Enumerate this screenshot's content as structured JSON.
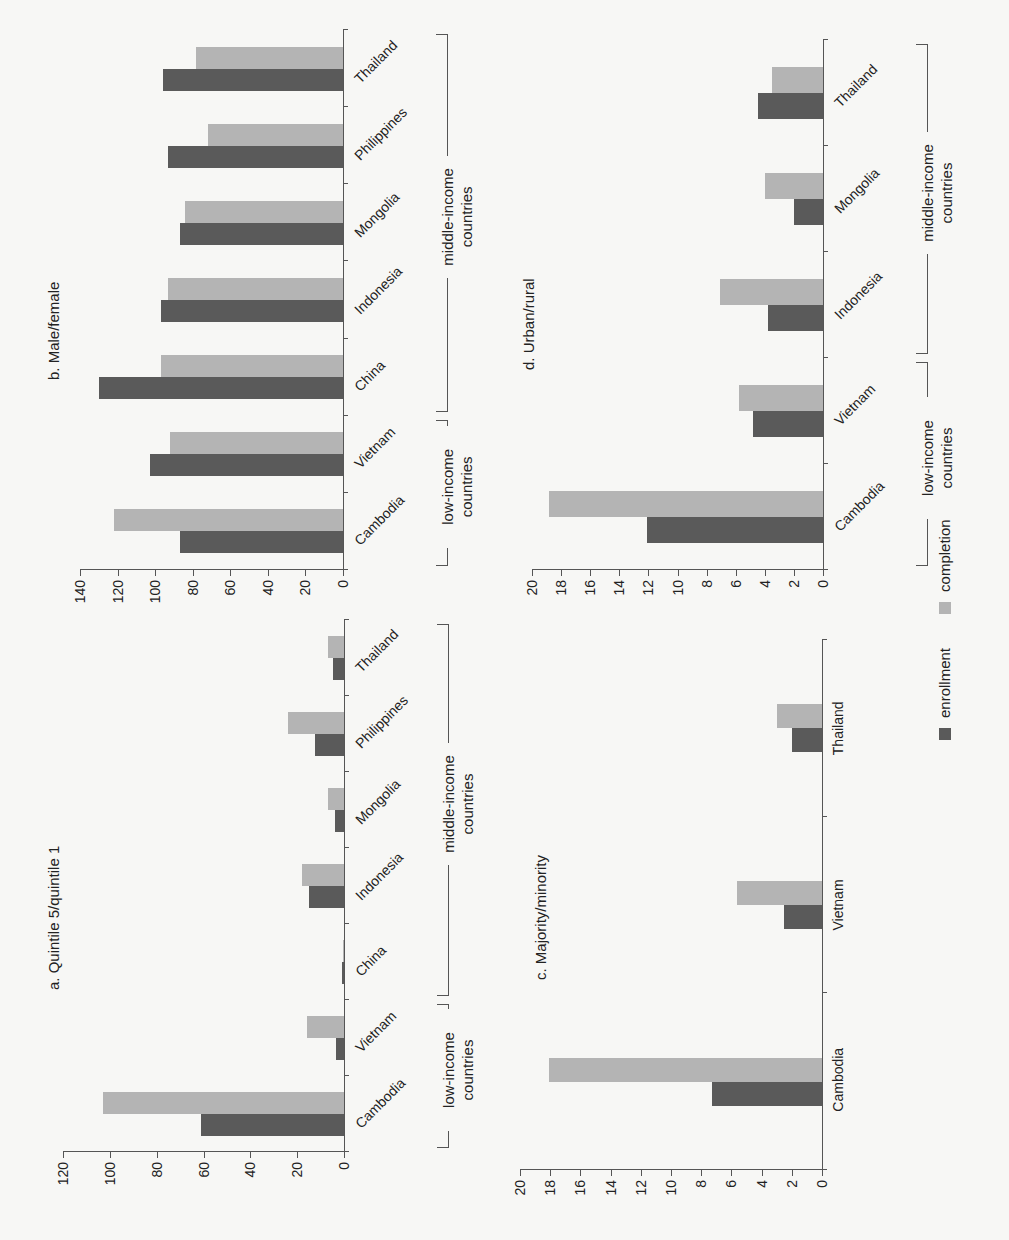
{
  "legend": {
    "enrollment_label": "enrollment",
    "completion_label": "completion",
    "enrollment_color": "#5a5a5a",
    "completion_color": "#b4b4b4"
  },
  "groups": {
    "low_income": "low-income countries",
    "middle_income": "middle-income countries"
  },
  "chart_data": [
    {
      "type": "bar",
      "title": "a. Quintile 5/quintile 1",
      "categories": [
        "Cambodia",
        "Vietnam",
        "China",
        "Indonesia",
        "Mongolia",
        "Philippines",
        "Thailand"
      ],
      "category_groups": {
        "low-income countries": [
          "Cambodia",
          "Vietnam"
        ],
        "middle-income countries": [
          "China",
          "Indonesia",
          "Mongolia",
          "Philippines",
          "Thailand"
        ]
      },
      "series": [
        {
          "name": "enrollment",
          "values": [
            61,
            3.5,
            1,
            15,
            4,
            12.5,
            4.5
          ]
        },
        {
          "name": "completion",
          "values": [
            103,
            16,
            0.5,
            18,
            7,
            24,
            7
          ]
        }
      ],
      "xlabel": "",
      "ylabel": "",
      "yticks": [
        0,
        20,
        40,
        60,
        80,
        100,
        120
      ],
      "ylim": [
        0,
        120
      ],
      "grid": false,
      "legend_position": "bottom"
    },
    {
      "type": "bar",
      "title": "b. Male/female",
      "categories": [
        "Cambodia",
        "Vietnam",
        "China",
        "Indonesia",
        "Mongolia",
        "Philippines",
        "Thailand"
      ],
      "category_groups": {
        "low-income countries": [
          "Cambodia",
          "Vietnam"
        ],
        "middle-income countries": [
          "China",
          "Indonesia",
          "Mongolia",
          "Philippines",
          "Thailand"
        ]
      },
      "series": [
        {
          "name": "enrollment",
          "values": [
            87,
            103,
            130,
            97,
            87,
            93,
            96
          ]
        },
        {
          "name": "completion",
          "values": [
            122,
            92,
            97,
            93,
            84,
            72,
            78
          ]
        }
      ],
      "xlabel": "",
      "ylabel": "",
      "yticks": [
        0,
        20,
        40,
        60,
        80,
        100,
        120,
        140
      ],
      "ylim": [
        0,
        140
      ],
      "grid": false,
      "legend_position": "bottom"
    },
    {
      "type": "bar",
      "title": "c. Majority/minority",
      "categories": [
        "Cambodia",
        "Vietnam",
        "Thailand"
      ],
      "series": [
        {
          "name": "enrollment",
          "values": [
            7.3,
            2.5,
            2.0
          ]
        },
        {
          "name": "completion",
          "values": [
            18.1,
            5.6,
            3.0
          ]
        }
      ],
      "xlabel": "",
      "ylabel": "",
      "yticks": [
        0,
        2,
        4,
        6,
        8,
        10,
        12,
        14,
        16,
        18,
        20
      ],
      "ylim": [
        0,
        20
      ],
      "grid": false,
      "legend_position": "bottom"
    },
    {
      "type": "bar",
      "title": "d. Urban/rural",
      "categories": [
        "Cambodia",
        "Vietnam",
        "Indonesia",
        "Mongolia",
        "Thailand"
      ],
      "category_groups": {
        "low-income countries": [
          "Cambodia",
          "Vietnam"
        ],
        "middle-income countries": [
          "Indonesia",
          "Mongolia",
          "Thailand"
        ]
      },
      "series": [
        {
          "name": "enrollment",
          "values": [
            12.1,
            4.8,
            3.8,
            2.0,
            4.5
          ]
        },
        {
          "name": "completion",
          "values": [
            18.8,
            5.8,
            7.1,
            4.0,
            3.5
          ]
        }
      ],
      "xlabel": "",
      "ylabel": "",
      "yticks": [
        0,
        2,
        4,
        6,
        8,
        10,
        12,
        14,
        16,
        18,
        20
      ],
      "ylim": [
        0,
        20
      ],
      "grid": false,
      "legend_position": "bottom"
    }
  ]
}
